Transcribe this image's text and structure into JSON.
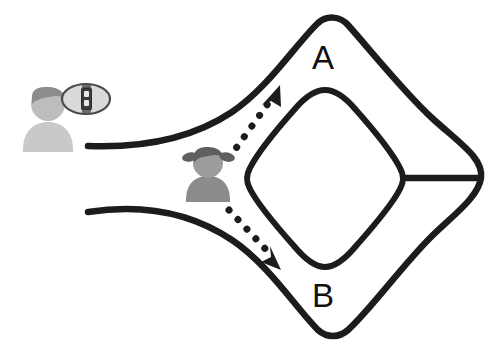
{
  "canvas": {
    "width": 500,
    "height": 350,
    "background": "#ffffff",
    "title": "Route choice diagram with two destinations"
  },
  "colors": {
    "road": "#1c1c1c",
    "arrow": "#1c1c1c",
    "label_text": "#111111",
    "traveler_body": "#c9c9c9",
    "traveler_head": "#bdbdbd",
    "traveler_hair": "#8c8c8c",
    "decider_body": "#8b8b8b",
    "decider_head": "#9c9c9c",
    "decider_hair": "#5f5f5f",
    "bubble_fill": "#d9d9d9",
    "bubble_stroke": "#4a4a4a",
    "signal_body": "#3a3a3a",
    "signal_lamp": "#e8e8e8"
  },
  "labels": {
    "route_a": "A",
    "route_b": "B"
  },
  "figures": {
    "traveler": {
      "name": "traveler-person",
      "x": 48,
      "y": 125
    },
    "decider": {
      "name": "decider-person",
      "x": 208,
      "y": 178
    }
  },
  "thought_bubble": {
    "name": "thought-bubble",
    "cx": 86,
    "cy": 99,
    "rx": 24,
    "ry": 15,
    "icon": "traffic-signal-icon"
  },
  "arrows": [
    {
      "name": "arrow-to-a",
      "direction": "up-right",
      "target_label": "A",
      "style": "dotted"
    },
    {
      "name": "arrow-to-b",
      "direction": "down-right",
      "target_label": "B",
      "style": "dotted"
    }
  ],
  "roads": {
    "approach_upper": "approach-road-upper-edge",
    "approach_lower": "approach-road-lower-edge",
    "outer_loop": "outer-loop-road",
    "inner_loop": "inner-loop-road",
    "connector": "right-connector-road"
  }
}
